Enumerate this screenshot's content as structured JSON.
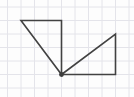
{
  "canvas": {
    "width": 134,
    "height": 97,
    "background": "#fdfdfd"
  },
  "grid": {
    "spacing": 13.5,
    "offset_x": 7.5,
    "offset_y": 7,
    "color": "#e4e4ea",
    "stroke_width": 1
  },
  "figure": {
    "stroke_color": "#424242",
    "stroke_width": 1.6,
    "fill": "none",
    "shapes": [
      {
        "name": "left-triangle",
        "type": "polygon",
        "description": "triangle with horizontal top edge, right angle at top-right, apex at shared bottom vertex",
        "points": [
          [
            21,
            20.5
          ],
          [
            61.5,
            20.5
          ],
          [
            61.5,
            74.5
          ]
        ],
        "grid_units": [
          [
            -3,
            4
          ],
          [
            0,
            4
          ],
          [
            0,
            0
          ]
        ]
      },
      {
        "name": "right-triangle",
        "type": "polygon",
        "description": "triangle with horizontal bottom edge, right angle at bottom-right, apex at shared bottom vertex",
        "points": [
          [
            61.5,
            74.5
          ],
          [
            115.5,
            34
          ],
          [
            115.5,
            74.5
          ]
        ],
        "grid_units": [
          [
            0,
            0
          ],
          [
            4,
            3
          ],
          [
            4,
            0
          ]
        ]
      }
    ],
    "vertex_dot": {
      "name": "shared-vertex-dot",
      "cx": 61.5,
      "cy": 74.5,
      "r": 2.4,
      "color": "#3d3d3d"
    }
  }
}
